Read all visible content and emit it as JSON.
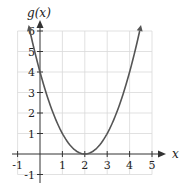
{
  "chart_data": {
    "type": "line",
    "title": "",
    "function": "g(x) = (x-2)^2",
    "xlabel": "x",
    "ylabel": "g(x)",
    "xlim": [
      -1,
      5
    ],
    "ylim": [
      -1,
      6
    ],
    "grid": true,
    "x_ticks": [
      "-1",
      "1",
      "2",
      "3",
      "4",
      "5"
    ],
    "y_ticks": [
      "-1",
      "1",
      "2",
      "3",
      "4",
      "5",
      "6"
    ],
    "series": [
      {
        "name": "g(x)",
        "x": [
          -0.45,
          0,
          0.5,
          1,
          1.5,
          2,
          2.5,
          3,
          3.5,
          4,
          4.45
        ],
        "y": [
          6.0,
          4,
          2.25,
          1,
          0.25,
          0,
          0.25,
          1,
          2.25,
          4,
          6.0
        ]
      }
    ],
    "vertex": [
      2,
      0
    ]
  }
}
